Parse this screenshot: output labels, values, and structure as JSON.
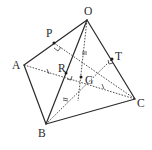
{
  "diagram": {
    "points": {
      "O": {
        "label": "O",
        "x": 87,
        "y": 20
      },
      "A": {
        "label": "A",
        "x": 24,
        "y": 65
      },
      "B": {
        "label": "B",
        "x": 46,
        "y": 124
      },
      "C": {
        "label": "C",
        "x": 135,
        "y": 99
      },
      "P": {
        "label": "P",
        "x": 54,
        "y": 43
      },
      "R": {
        "label": "R",
        "x": 66,
        "y": 73
      },
      "G": {
        "label": "G",
        "x": 81,
        "y": 77
      },
      "T": {
        "label": "T",
        "x": 112,
        "y": 59
      }
    },
    "solid_edges": [
      "OA",
      "OB",
      "OC",
      "AB",
      "BC"
    ],
    "dashed_segments": [
      "AC",
      "OG-extension",
      "BT",
      "PC",
      "BG"
    ],
    "tick_marks": "equal-length markers on AR, RG... (single slash / double slash)",
    "right_angles": [
      "P",
      "R",
      "T"
    ],
    "colors": {
      "line": "#2a2a2a",
      "background": "#ffffff"
    }
  }
}
